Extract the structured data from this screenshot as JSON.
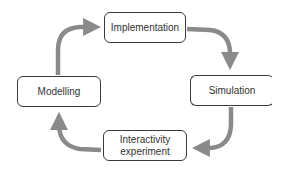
{
  "diagram": {
    "type": "cycle",
    "colors": {
      "arrow": "#8a8a8a",
      "node_border": "#3a3a3a",
      "node_fill": "#ffffff",
      "text": "#333333",
      "background": "#ffffff"
    },
    "nodes": [
      {
        "id": "implementation",
        "label": "Implementation",
        "lines": [
          "Implementation"
        ]
      },
      {
        "id": "simulation",
        "label": "Simulation",
        "lines": [
          "Simulation"
        ]
      },
      {
        "id": "interactivity",
        "label": "Interactivity experiment",
        "lines": [
          "Interactivity",
          "experiment"
        ]
      },
      {
        "id": "modelling",
        "label": "Modelling",
        "lines": [
          "Modelling"
        ]
      }
    ],
    "edges": [
      {
        "from": "modelling",
        "to": "implementation"
      },
      {
        "from": "implementation",
        "to": "simulation"
      },
      {
        "from": "simulation",
        "to": "interactivity"
      },
      {
        "from": "interactivity",
        "to": "modelling"
      }
    ]
  }
}
